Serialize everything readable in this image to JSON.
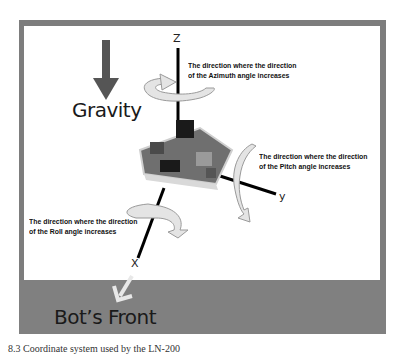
{
  "diagram": {
    "gravity_label": "Gravity",
    "front_label": "Bot’s Front",
    "axes": {
      "z": "Z",
      "y": "y",
      "x": "X"
    },
    "notes": {
      "azimuth": [
        "The direction where the direction",
        "of the Azimuth angle increases"
      ],
      "pitch": [
        "The direction where the direction",
        "of the Pitch angle increases"
      ],
      "roll": [
        "The direction where the direction",
        "of the Roll angle increases"
      ]
    },
    "caption": "8.3  Coordinate system used by the LN-200"
  },
  "colors": {
    "frame": "#7d7d7d",
    "front_strip": "#808080",
    "gravity_arrow": "#555555",
    "rotation_arrow_fill": "#e4e4e4",
    "rotation_arrow_stroke": "#9a9a9a",
    "axis_line": "#000000",
    "board": "#6f6f6f"
  }
}
